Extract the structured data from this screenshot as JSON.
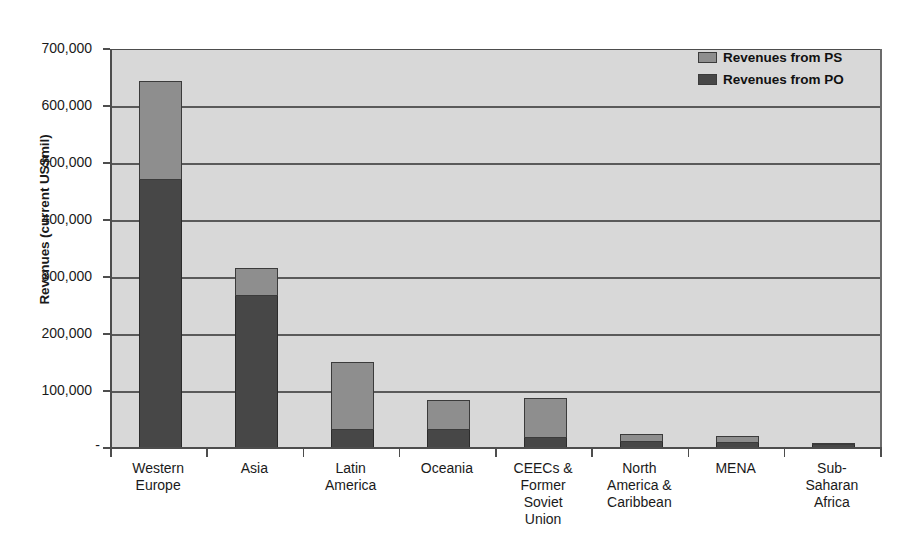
{
  "chart_data": {
    "type": "bar",
    "subtype": "stacked-vertical",
    "title": "",
    "xlabel": "",
    "ylabel": "Revenues (current US$mil)",
    "ylim": [
      0,
      700000
    ],
    "ytick_values": [
      0,
      100000,
      200000,
      300000,
      400000,
      500000,
      600000,
      700000
    ],
    "ytick_labels": [
      "-",
      "100,000",
      "200,000",
      "300,000",
      "400,000",
      "500,000",
      "600,000",
      "700,000"
    ],
    "grid": true,
    "grid_axis": "y",
    "legend_position": "top-right",
    "categories": [
      "Western Europe",
      "Asia",
      "Latin America",
      "Oceania",
      "CEECs & Former Soviet Union",
      "North America & Caribbean",
      "MENA",
      "Sub-Saharan Africa"
    ],
    "category_label_lines": [
      [
        "Western",
        "Europe"
      ],
      [
        "Asia"
      ],
      [
        "Latin",
        "America"
      ],
      [
        "Oceania"
      ],
      [
        "CEECs &",
        "Former",
        "Soviet",
        "Union"
      ],
      [
        "North",
        "America &",
        "Caribbean"
      ],
      [
        "MENA"
      ],
      [
        "Sub-",
        "Saharan",
        "Africa"
      ]
    ],
    "series": [
      {
        "name": "Revenues from PO",
        "color": "#474747",
        "stack_order": 0,
        "values": [
          472000,
          268000,
          33000,
          34000,
          20000,
          13000,
          11000,
          6500
        ]
      },
      {
        "name": "Revenues from PS",
        "color": "#8e8e8e",
        "stack_order": 1,
        "values": [
          173000,
          50000,
          120000,
          52000,
          69000,
          14000,
          12000,
          1500
        ]
      }
    ],
    "totals": [
      645000,
      318000,
      153000,
      86000,
      89000,
      27000,
      23000,
      8000
    ],
    "plot_background_color": "#d8d8d8",
    "axis_color": "#4d4d4d"
  },
  "legend": {
    "items": [
      {
        "label": "Revenues from PS",
        "color": "#8e8e8e"
      },
      {
        "label": "Revenues from PO",
        "color": "#474747"
      }
    ]
  }
}
